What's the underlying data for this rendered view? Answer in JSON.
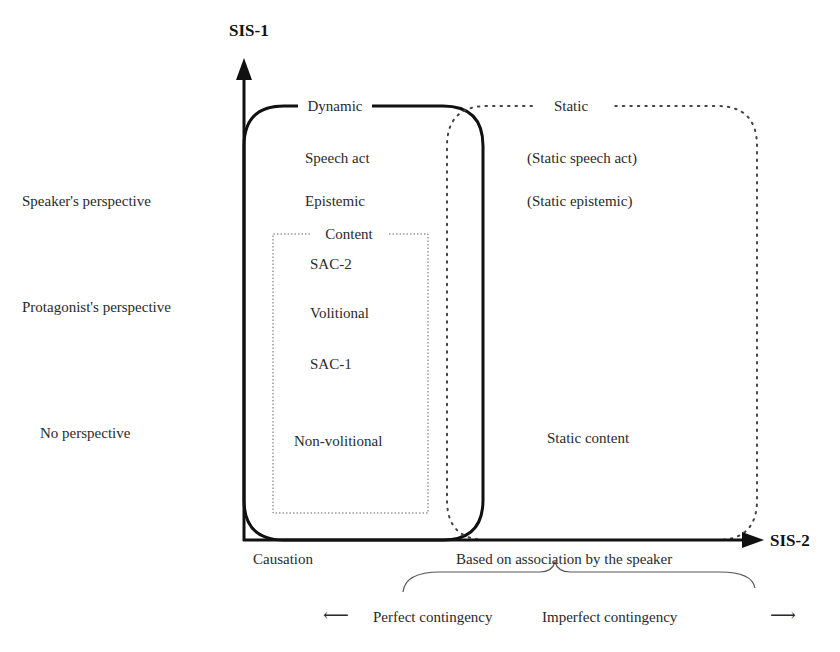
{
  "axes": {
    "y_title": "SIS-1",
    "x_title": "SIS-2"
  },
  "y_labels": [
    "Speaker's perspective",
    "Protagonist's perspective",
    "No perspective"
  ],
  "boxes": {
    "dynamic": {
      "title": "Dynamic",
      "border": "solid",
      "items": [
        "Speech act",
        "Epistemic"
      ]
    },
    "content": {
      "title": "Content",
      "border": "dotted",
      "items": [
        "SAC-2",
        "Volitional",
        "SAC-1",
        "Non-volitional"
      ]
    },
    "static": {
      "title": "Static",
      "border": "dotted",
      "items": [
        "(Static speech act)",
        "(Static epistemic)",
        "Static content"
      ]
    }
  },
  "x_labels": {
    "causation": "Causation",
    "association": "Based on association by the speaker"
  },
  "contingency": {
    "perfect": "Perfect contingency",
    "imperfect": "Imperfect contingency",
    "left_arrow": "⟵",
    "right_arrow": "⟶"
  },
  "colors": {
    "line": "#111111",
    "text": "#2a2a2a",
    "dotted": "#555555"
  }
}
